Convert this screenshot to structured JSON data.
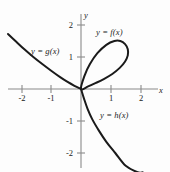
{
  "chart_data": {
    "type": "line",
    "title": "",
    "xlabel": "x",
    "ylabel": "y",
    "xlim": [
      -2.5,
      2.6
    ],
    "ylim": [
      -2.6,
      2.4
    ],
    "grid": false,
    "legend": "inline-annotations",
    "xticks": [
      -2,
      -1,
      1,
      2
    ],
    "xtick_labels": [
      "-2",
      "-1",
      "1",
      "2"
    ],
    "yticks": [
      2,
      1,
      -1,
      -2
    ],
    "ytick_labels": [
      "2",
      "1",
      "-1",
      "-2"
    ],
    "series": [
      {
        "name": "y = f(x)",
        "label": "y = f(x)",
        "role": "upper loop branch",
        "points": [
          [
            0,
            0
          ],
          [
            0.12,
            0.42
          ],
          [
            0.3,
            0.78
          ],
          [
            0.55,
            1.12
          ],
          [
            0.85,
            1.38
          ],
          [
            1.12,
            1.5
          ],
          [
            1.32,
            1.5
          ],
          [
            1.48,
            1.4
          ],
          [
            1.57,
            1.24
          ],
          [
            1.57,
            1.05
          ],
          [
            1.48,
            0.86
          ],
          [
            1.3,
            0.66
          ],
          [
            1.05,
            0.47
          ],
          [
            0.78,
            0.32
          ],
          [
            0.5,
            0.19
          ],
          [
            0.24,
            0.08
          ],
          [
            0,
            0
          ]
        ]
      },
      {
        "name": "y = g(x)",
        "label": "y = g(x)",
        "role": "upper-left decreasing branch",
        "points": [
          [
            -2.45,
            1.72
          ],
          [
            -2.2,
            1.5
          ],
          [
            -1.9,
            1.24
          ],
          [
            -1.6,
            1.0
          ],
          [
            -1.3,
            0.78
          ],
          [
            -1.0,
            0.57
          ],
          [
            -0.7,
            0.37
          ],
          [
            -0.45,
            0.22
          ],
          [
            -0.22,
            0.1
          ],
          [
            0,
            0
          ]
        ]
      },
      {
        "name": "y = h(x)",
        "label": "y = h(x)",
        "role": "lower-right decreasing branch",
        "points": [
          [
            0,
            0
          ],
          [
            0.1,
            -0.3
          ],
          [
            0.22,
            -0.62
          ],
          [
            0.38,
            -0.95
          ],
          [
            0.6,
            -1.3
          ],
          [
            0.85,
            -1.65
          ],
          [
            1.15,
            -2.0
          ],
          [
            1.5,
            -2.4
          ],
          [
            1.9,
            -2.6
          ],
          [
            2.07,
            -2.6
          ]
        ]
      }
    ]
  },
  "axes": {
    "x_axis_label": "x",
    "y_axis_label": "y"
  },
  "labels": {
    "f": "y = f(x)",
    "g": "y = g(x)",
    "h": "y = h(x)"
  },
  "colors": {
    "curve": "#1a1a1a",
    "axis": "#8a8a8a",
    "background": "#fdfdfd",
    "text": "#1a1a1a"
  }
}
